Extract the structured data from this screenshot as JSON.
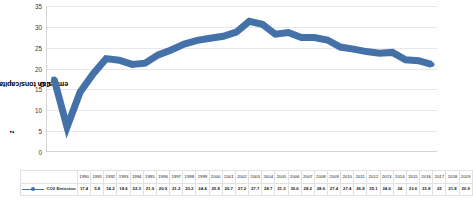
{
  "chart_data": {
    "type": "line",
    "title": "",
    "xlabel": "",
    "ylabel": "CO2 emission tons/capita per year",
    "ylabel_prefix": "CO",
    "ylabel_sub": "2",
    "ylabel_suffix": " emission tons/capita per year",
    "ylim": [
      0,
      35
    ],
    "yticks": [
      0,
      5,
      10,
      15,
      20,
      25,
      30,
      35
    ],
    "grid": true,
    "legend_position": "bottom-left",
    "series_color": "#4472a8",
    "categories": [
      "1990",
      "1991",
      "1992",
      "1993",
      "1994",
      "1995",
      "1996",
      "1997",
      "1998",
      "1999",
      "2000",
      "2001",
      "2002",
      "2003",
      "2004",
      "2005",
      "2006",
      "2007",
      "2008",
      "2009",
      "2010",
      "2011",
      "2012",
      "2013",
      "2014",
      "2015",
      "2016",
      "2017",
      "2018",
      "2019"
    ],
    "series": [
      {
        "name": "CO2 Emission",
        "values": [
          17.4,
          5.8,
          14.2,
          18.6,
          22.3,
          21.9,
          20.9,
          21.2,
          23.2,
          24.4,
          25.8,
          26.7,
          27.2,
          27.7,
          28.7,
          31.3,
          30.6,
          28.2,
          28.6,
          27.4,
          27.4,
          26.8,
          25.1,
          24.6,
          24.0,
          23.6,
          23.8,
          22.0,
          21.8,
          20.9
        ]
      }
    ]
  },
  "legend": {
    "label": "CO2 Emission"
  }
}
